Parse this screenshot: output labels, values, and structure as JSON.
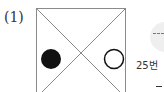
{
  "problem": {
    "label": "(1)",
    "figure": {
      "shape": "square-with-diagonals",
      "left_marker": "filled-circle",
      "right_marker": "hollow-circle",
      "stroke_color": "#8a8a8a",
      "marker_color": "#111111"
    }
  },
  "side_panel": {
    "icon": "gray-circle-dash-icon",
    "text": "25번"
  }
}
